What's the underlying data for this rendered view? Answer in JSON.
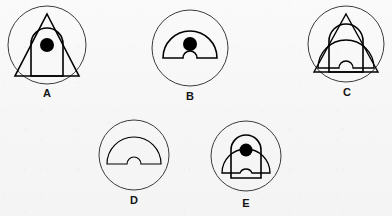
{
  "canvas": {
    "width": 392,
    "height": 216,
    "background_color": "#f6f6f6"
  },
  "style": {
    "outer_circle_color": "#3b3b3b",
    "outer_circle_width": 1,
    "inner_shape_color": "#000000",
    "inner_shape_width": 1.6,
    "dot_color": "#000000",
    "fill_color": "none",
    "label_color": "#141414"
  },
  "figures": [
    {
      "id": "A",
      "label": "A",
      "circle": {
        "cx": 47,
        "cy": 45,
        "r": 39
      },
      "shapes": [
        "triangle",
        "arch",
        "dot"
      ],
      "has_dot": true,
      "dot": {
        "cx": 47,
        "cy": 45,
        "r": 7
      },
      "triangle": {
        "apex_x": 47,
        "apex_y": 14,
        "left_x": 15,
        "right_x": 79,
        "base_y": 76
      },
      "arch": {
        "left_x": 31,
        "right_x": 63,
        "base_y": 76,
        "top_y": 44,
        "dome_r": 16
      },
      "label_pos": {
        "x": 47,
        "y": 93
      }
    },
    {
      "id": "B",
      "label": "B",
      "circle": {
        "cx": 190,
        "cy": 48,
        "r": 38
      },
      "shapes": [
        "dome-notch",
        "dot"
      ],
      "has_dot": true,
      "dot": {
        "cx": 190,
        "cy": 44,
        "r": 7
      },
      "dome": {
        "cx": 190,
        "cy": 58,
        "r": 27,
        "notch_r": 7
      },
      "label_pos": {
        "x": 190,
        "y": 96
      }
    },
    {
      "id": "C",
      "label": "C",
      "circle": {
        "cx": 346,
        "cy": 44,
        "r": 38
      },
      "shapes": [
        "triangle",
        "arch",
        "dome-notch"
      ],
      "has_dot": false,
      "triangle": {
        "apex_x": 346,
        "apex_y": 14,
        "left_x": 314,
        "right_x": 378,
        "base_y": 72
      },
      "arch": {
        "left_x": 329,
        "right_x": 363,
        "base_y": 72,
        "top_y": 41,
        "dome_r": 17
      },
      "dome": {
        "cx": 346,
        "cy": 68,
        "r": 28,
        "notch_r": 7
      },
      "label_pos": {
        "x": 346,
        "y": 92
      }
    },
    {
      "id": "D",
      "label": "D",
      "circle": {
        "cx": 134,
        "cy": 155,
        "r": 35
      },
      "shapes": [
        "dome-notch"
      ],
      "has_dot": false,
      "dome": {
        "cx": 134,
        "cy": 164,
        "r": 27,
        "notch_r": 7
      },
      "label_pos": {
        "x": 134,
        "y": 200
      }
    },
    {
      "id": "E",
      "label": "E",
      "circle": {
        "cx": 246,
        "cy": 156,
        "r": 35
      },
      "shapes": [
        "arch",
        "dome-notch",
        "dot"
      ],
      "has_dot": true,
      "dot": {
        "cx": 246,
        "cy": 150,
        "r": 6.5
      },
      "arch": {
        "left_x": 232,
        "right_x": 262,
        "base_y": 178,
        "top_y": 150,
        "dome_r": 15
      },
      "dome": {
        "cx": 246,
        "cy": 173,
        "r": 24,
        "notch_r": 6.5
      },
      "label_pos": {
        "x": 246,
        "y": 203
      }
    }
  ]
}
